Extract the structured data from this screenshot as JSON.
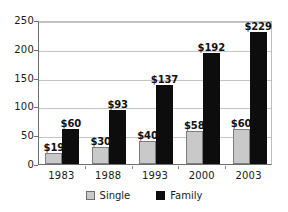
{
  "chart_data": {
    "type": "bar",
    "title": "",
    "subtitle": "",
    "xlabel": "",
    "ylabel": "",
    "categories": [
      "1983",
      "1988",
      "1993",
      "2000",
      "2003"
    ],
    "series": [
      {
        "name": "Single",
        "color": "#c9c9c9",
        "values": [
          19,
          30,
          40,
          58,
          60
        ],
        "labels": [
          "$19",
          "$30",
          "$40",
          "$58",
          "$60"
        ]
      },
      {
        "name": "Family",
        "color": "#0d0d0d",
        "values": [
          60,
          93,
          137,
          192,
          229
        ],
        "labels": [
          "$60",
          "$93",
          "$137",
          "$192",
          "$229"
        ]
      }
    ],
    "ylim": [
      0,
      250
    ],
    "yticks": [
      0,
      50,
      100,
      150,
      200,
      250
    ],
    "ytick_labels": [
      "0",
      "50",
      "100",
      "150",
      "200",
      "250"
    ],
    "grid": true,
    "grid_axis": "y",
    "legend_position": "bottom"
  },
  "legend": {
    "items": [
      {
        "label": "Single",
        "marker": "square-swatch-gray"
      },
      {
        "label": "Family",
        "marker": "square-swatch-black"
      }
    ]
  },
  "colors": {
    "single": "#c9c9c9",
    "family": "#0d0d0d",
    "grid": "#c4c4c4",
    "axis": "#6e6e6e",
    "background": "#ffffff",
    "text": "#1a1a1a"
  }
}
